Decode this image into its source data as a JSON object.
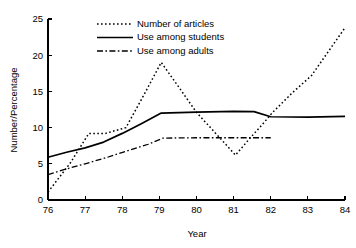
{
  "chart_data": {
    "type": "line",
    "title": "",
    "xlabel": "Year",
    "ylabel": "Number/Percentage",
    "xlim": [
      76,
      84
    ],
    "ylim": [
      0,
      25
    ],
    "xticks": [
      "76",
      "77",
      "78",
      "79",
      "80",
      "81",
      "82",
      "83",
      "84"
    ],
    "yticks": [
      "0",
      "5",
      "10",
      "15",
      "20",
      "25"
    ],
    "grid": false,
    "legend_position": "top-left",
    "series": [
      {
        "name": "Number of articles",
        "style": "dotted",
        "x": [
          76,
          76.6,
          77.1,
          77.55,
          78.1,
          78.55,
          79.05,
          79.55,
          80.0,
          80.5,
          81.05,
          81.45,
          81.75,
          82.05,
          82.6,
          83.1,
          84.0
        ],
        "values": [
          1.1,
          5.1,
          9.2,
          9.2,
          10.0,
          14.2,
          19.0,
          15.4,
          12.1,
          9.3,
          6.2,
          8.6,
          10.3,
          12.1,
          14.9,
          17.2,
          23.8
        ]
      },
      {
        "name": "Use among students",
        "style": "solid",
        "x": [
          76,
          76.5,
          77.0,
          77.5,
          78.0,
          78.5,
          79.05,
          80.0,
          81.0,
          81.55,
          82.0,
          83.0,
          84.0
        ],
        "values": [
          5.9,
          6.6,
          7.2,
          8.0,
          9.2,
          10.5,
          12.0,
          12.15,
          12.25,
          12.2,
          11.5,
          11.45,
          11.55
        ]
      },
      {
        "name": "Use among adults",
        "style": "dashdot",
        "x": [
          76,
          76.5,
          77.0,
          77.6,
          78.2,
          78.7,
          79.1,
          80.0,
          81.0,
          82.0
        ],
        "values": [
          3.5,
          4.3,
          5.0,
          5.9,
          6.9,
          7.7,
          8.55,
          8.6,
          8.6,
          8.6
        ]
      }
    ]
  },
  "legend": {
    "items": [
      {
        "label": "Number of articles",
        "style": "dotted"
      },
      {
        "label": "Use among students",
        "style": "solid"
      },
      {
        "label": "Use among adults",
        "style": "dashdot"
      }
    ]
  },
  "axes": {
    "x_title": "Year",
    "y_title": "Number/Percentage"
  },
  "colors": {
    "ink": "#000000",
    "background": "#ffffff"
  }
}
